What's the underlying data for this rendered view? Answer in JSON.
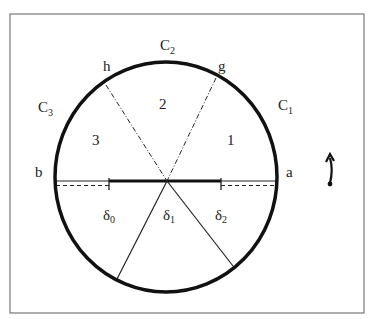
{
  "figure": {
    "frame": {
      "x": 10,
      "y": 14,
      "width": 354,
      "height": 299,
      "stroke": "#777777"
    },
    "circle": {
      "cx": 166,
      "cy": 177,
      "rx": 111,
      "ry": 115,
      "stroke": "#111111",
      "stroke_width": 3.5
    },
    "center": {
      "x": 167,
      "y": 181
    },
    "labels": {
      "C1": {
        "base": "C",
        "sub": "1"
      },
      "C2": {
        "base": "C",
        "sub": "2"
      },
      "C3": {
        "base": "C",
        "sub": "3"
      },
      "a": "a",
      "b": "b",
      "g": "g",
      "h": "h",
      "region_1": "1",
      "region_2": "2",
      "region_3": "3",
      "delta0": {
        "base": "δ",
        "sub": "0"
      },
      "delta1": {
        "base": "δ",
        "sub": "1"
      },
      "delta2": {
        "base": "δ",
        "sub": "2"
      }
    },
    "lines": {
      "dashdot_h": {
        "from": [
          106,
          85
        ],
        "to": [
          167,
          181
        ]
      },
      "dashdot_g": {
        "from": [
          216,
          78
        ],
        "to": [
          167,
          181
        ]
      },
      "chord_lower_left": {
        "from": [
          167,
          181
        ],
        "to": [
          117,
          279
        ]
      },
      "chord_lower_right": {
        "from": [
          167,
          181
        ],
        "to": [
          233,
          266
        ]
      },
      "diameter_thin": {
        "from": [
          55,
          181
        ],
        "to": [
          277,
          181
        ]
      },
      "diameter_thick": {
        "from": [
          109,
          181
        ],
        "to": [
          221,
          181
        ]
      },
      "dashed_left": {
        "from": [
          55,
          185
        ],
        "to": [
          109,
          185
        ]
      },
      "dashed_right": {
        "from": [
          221,
          185
        ],
        "to": [
          277,
          185
        ]
      },
      "tick_left": {
        "x": 109,
        "y1": 178,
        "y2": 190
      },
      "tick_right": {
        "x": 221,
        "y1": 178,
        "y2": 190
      }
    },
    "rotation_arrow": {
      "icon": "curved-up-arrow-icon",
      "direction": "counterclockwise"
    }
  }
}
